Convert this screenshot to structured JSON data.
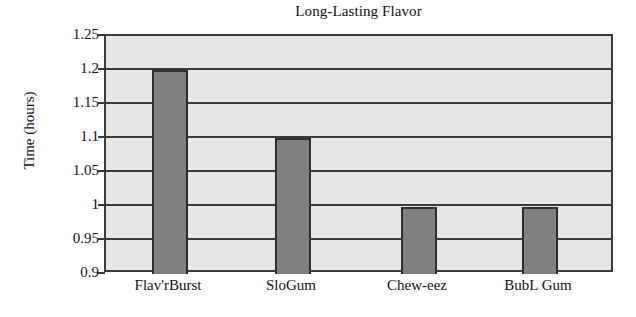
{
  "chart_data": {
    "type": "bar",
    "title": "Long-Lasting Flavor",
    "xlabel": "",
    "ylabel": "Time (hours)",
    "categories": [
      "Flav'rBurst",
      "SloGum",
      "Chew-eez",
      "BubL Gum"
    ],
    "values": [
      1.2,
      1.1,
      0.998,
      0.998
    ],
    "value_labels": [
      "1.2",
      "1.1",
      "1",
      "1"
    ],
    "ylim": [
      0.9,
      1.25
    ],
    "yticks": [
      0.9,
      0.95,
      1,
      1.05,
      1.1,
      1.15,
      1.2,
      1.25
    ],
    "ytick_labels": [
      "0.9",
      "0.95",
      "1",
      "1.05",
      "1.1",
      "1.15",
      "1.2",
      "1.25"
    ],
    "grid": true,
    "grid_axis": "y",
    "legend": null,
    "legend_position": "none",
    "bar_color": "#808080",
    "plot_background": "#e6e6e4",
    "axis_color": "#3a3a3a",
    "figure_background": "#ffffff"
  },
  "axes": {
    "title": "Long-Lasting Flavor",
    "y_axis_title": "Time (hours)"
  }
}
